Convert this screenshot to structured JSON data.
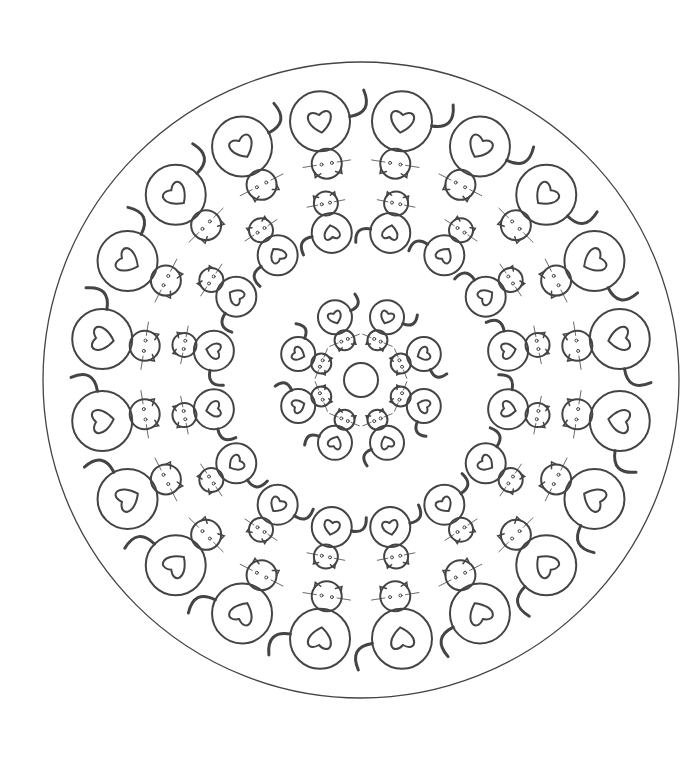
{
  "page": {
    "background": "#ffffff",
    "stroke": "#444444",
    "title": ""
  },
  "mandala": {
    "center": [
      361,
      380
    ],
    "outer_radius": 318,
    "center_circle_radius": 17,
    "rings": [
      {
        "name": "inner",
        "count": 8,
        "radius": 68,
        "body_r": 17,
        "head_r": 10,
        "offset_deg": 22.5,
        "outward": true
      },
      {
        "name": "middle",
        "count": 16,
        "radius": 150,
        "body_r": 20,
        "head_r": 12,
        "offset_deg": 11.25,
        "outward": false
      },
      {
        "name": "outer",
        "count": 20,
        "radius": 262,
        "body_r": 30,
        "head_r": 15,
        "offset_deg": 9,
        "outward": true
      }
    ]
  }
}
